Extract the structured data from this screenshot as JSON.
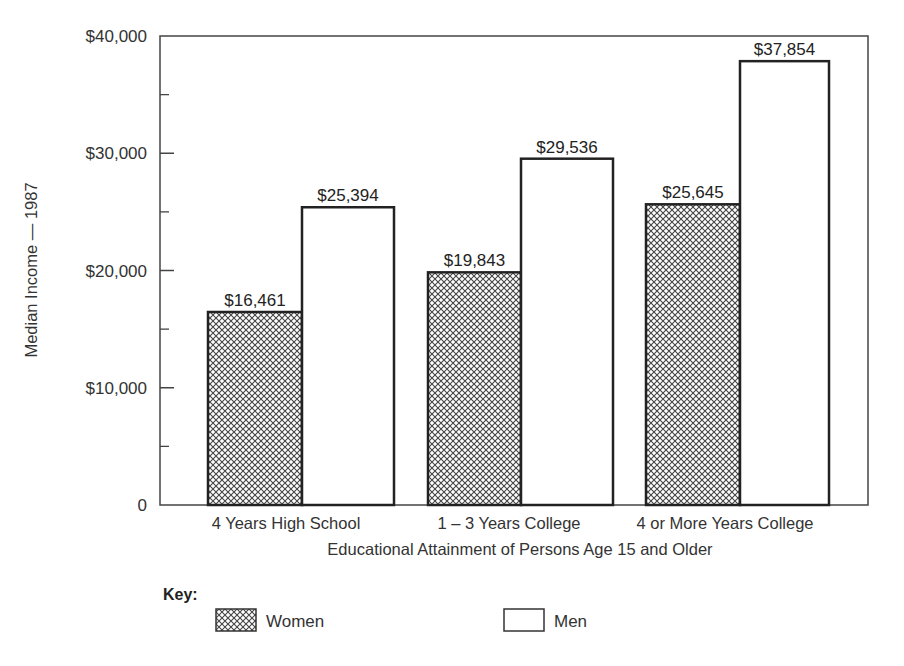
{
  "chart_data": {
    "type": "bar",
    "title": "",
    "xlabel": "Educational Attainment of Persons Age 15 and Older",
    "ylabel": "Median Income — 1987",
    "ylim": [
      0,
      40000
    ],
    "yticks": [
      0,
      10000,
      20000,
      30000,
      40000
    ],
    "ytick_labels": [
      "0",
      "$10,000",
      "$20,000",
      "$30,000",
      "$40,000"
    ],
    "minor_ticks": [
      5000,
      15000,
      25000,
      35000
    ],
    "grid": false,
    "categories": [
      "4 Years High School",
      "1 – 3 Years College",
      "4 or More Years College"
    ],
    "series": [
      {
        "name": "Women",
        "pattern": "crosshatch",
        "values": [
          16461,
          19843,
          25645
        ],
        "labels": [
          "$16,461",
          "$19,843",
          "$25,645"
        ]
      },
      {
        "name": "Men",
        "pattern": "none",
        "values": [
          25394,
          29536,
          37854
        ],
        "labels": [
          "$25,394",
          "$29,536",
          "$37,854"
        ]
      }
    ],
    "legend": {
      "title": "Key:",
      "position": "bottom-left",
      "entries": [
        "Women",
        "Men"
      ]
    }
  },
  "colors": {
    "stroke": "#2a2a2a",
    "text": "#333333",
    "background": "#ffffff"
  }
}
